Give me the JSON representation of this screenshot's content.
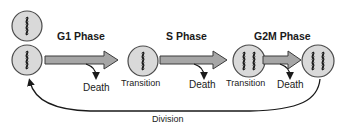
{
  "phases": [
    {
      "label": "G1 Phase"
    },
    {
      "label": "S Phase"
    },
    {
      "label": "G2M Phase"
    }
  ],
  "states": [
    {
      "label": "",
      "chromosomes": 1
    },
    {
      "label": "",
      "chromosomes": 1
    },
    {
      "label": "Transition",
      "chromosomes": 1
    },
    {
      "label": "Transition",
      "chromosomes": 2
    },
    {
      "label": "",
      "chromosomes": 2
    }
  ],
  "death_labels": [
    "Death",
    "Death",
    "Death"
  ],
  "division_label": "Division",
  "colors": {
    "cell_fill": "#d9d9d9",
    "cell_stroke": "#4a4a4a",
    "arrow_fill": "#a6a6a6",
    "arrow_stroke": "#3a3a3a",
    "line": "#1a1a1a"
  }
}
